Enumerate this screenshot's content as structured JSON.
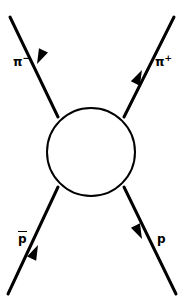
{
  "figure": {
    "type": "feynman-blob-diagram",
    "title": "",
    "background_color": "#ffffff",
    "line_color": "#000000",
    "width": 184,
    "height": 308
  },
  "blob": {
    "name": "interaction-blob",
    "shape": "circle",
    "cx": 91,
    "cy": 152,
    "r": 44,
    "stroke_width": 2,
    "fill": "#ffffff"
  },
  "labels": {
    "pi_minus": {
      "symbol": "π",
      "charge": "−",
      "text": "π−"
    },
    "pi_plus": {
      "symbol": "π",
      "charge": "+",
      "text": "π+"
    },
    "p_bar": {
      "symbol": "p",
      "overbar": true,
      "text": "p̄"
    },
    "p": {
      "symbol": "p",
      "overbar": false,
      "text": "p"
    }
  },
  "legs": [
    {
      "name": "leg-pi-minus",
      "label": "π−",
      "corner": "top-left",
      "direction": "outgoing",
      "arrow_points": "up-left",
      "x1": 58,
      "y1": 117,
      "x2": 10,
      "y2": 17
    },
    {
      "name": "leg-pi-plus",
      "label": "π+",
      "corner": "top-right",
      "direction": "incoming",
      "arrow_points": "down-left",
      "x1": 174,
      "y1": 17,
      "x2": 124,
      "y2": 117
    },
    {
      "name": "leg-p-bar",
      "label": "p̄",
      "corner": "bottom-left",
      "direction": "outgoing",
      "arrow_points": "down-left",
      "x1": 58,
      "y1": 187,
      "x2": 8,
      "y2": 294
    },
    {
      "name": "leg-p",
      "label": "p",
      "corner": "bottom-right",
      "direction": "incoming",
      "arrow_points": "up-left",
      "x1": 176,
      "y1": 294,
      "x2": 124,
      "y2": 187
    }
  ],
  "arrowheads": [
    {
      "name": "arrowhead-pi-minus",
      "x": 38,
      "y": 66,
      "angle_deg": 244
    },
    {
      "name": "arrowhead-pi-plus",
      "x": 141,
      "y": 68,
      "angle_deg": 117
    },
    {
      "name": "arrowhead-p-bar",
      "x": 39,
      "y": 243,
      "angle_deg": 115
    },
    {
      "name": "arrowhead-p",
      "x": 141,
      "y": 241,
      "angle_deg": 244
    }
  ]
}
